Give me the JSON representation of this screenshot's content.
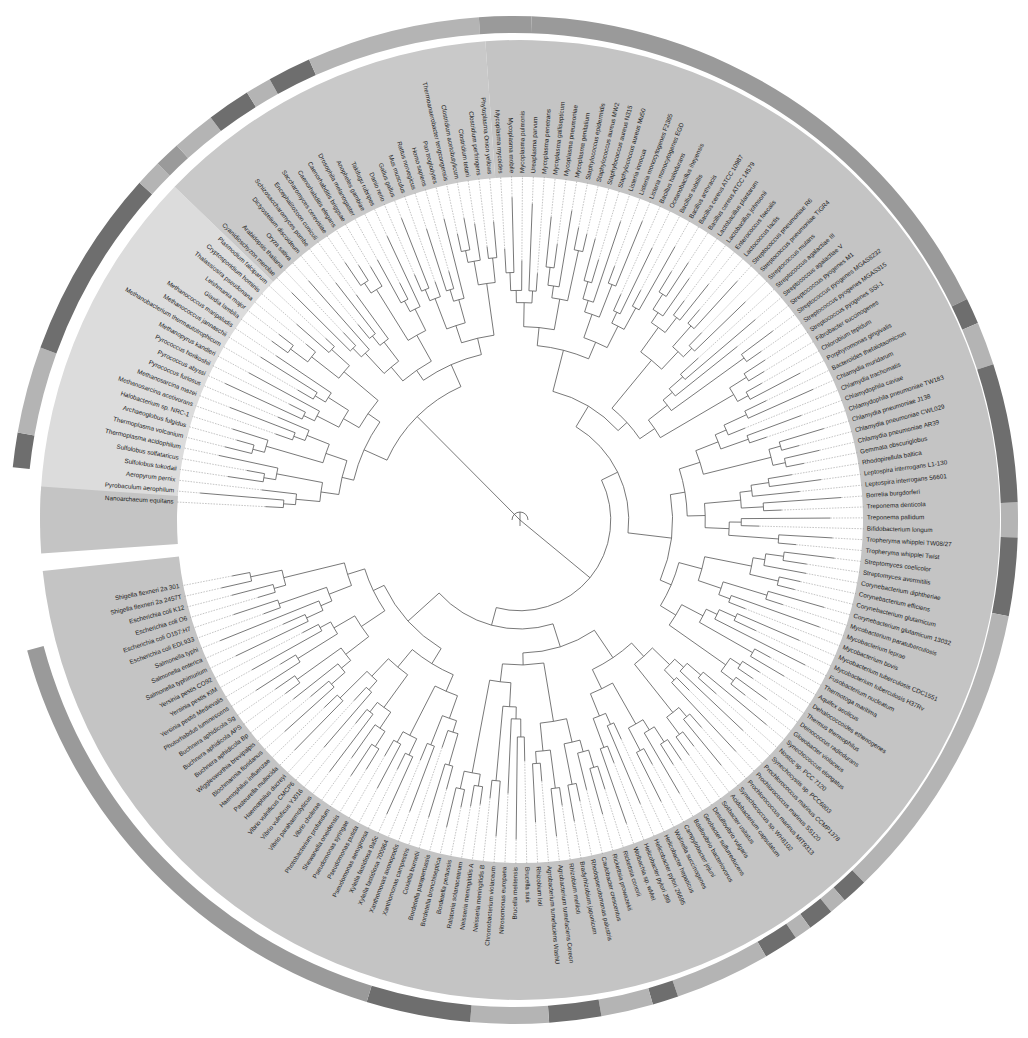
{
  "chart_data": {
    "type": "circular-phylogenetic-tree",
    "title": "",
    "center": [
      520,
      520
    ],
    "layout": {
      "start_angle_deg": 183,
      "end_angle_deg": 529,
      "label_inner_radius": 347,
      "band_inner_radius": 343,
      "band_outer_radius": 480,
      "white_gap_radius": 484,
      "ring_inner_radius": 487,
      "ring_outer_radius": 504,
      "tree_outer_radius": 335
    },
    "colors": {
      "archaea_band": "#dcdcdc",
      "eukaryota_band": "#c9c9c9",
      "bacteria_band": "#c4c4c4",
      "ring_light": "#b4b4b4",
      "ring_mid": "#9a9a9a",
      "ring_dark": "#6e6e6e",
      "branch": "#555555",
      "label": "#222222"
    },
    "clades": [
      {
        "name": "Archaea",
        "from": 0,
        "to": 22,
        "band": "archaea_band"
      },
      {
        "name": "Eukaryota",
        "from": 23,
        "to": 45,
        "band": "eukaryota_band"
      },
      {
        "name": "Bacteria",
        "from": 46,
        "to": 190,
        "band": "bacteria_band"
      }
    ],
    "leaves": [
      "Nanoarchaeum equitans",
      "Pyrobaculum aerophilum",
      "Aeropyrum pernix",
      "Sulfolobus tokodaii",
      "Sulfolobus solfataricus",
      "Thermoplasma acidophilum",
      "Thermoplasma volcanium",
      "Archaeoglobus fulgidus",
      "Halobacterium sp. NRC-1",
      "Methanosarcina acetivorans",
      "Methanosarcina mazei",
      "Pyrococcus furiosus",
      "Pyrococcus abyssi",
      "Pyrococcus horikoshii",
      "Methanopyrus kandleri",
      "Methanobacterium thermautotrophicum",
      "Methanococcus jannaschii",
      "Methanococcus maripaludis",
      "Giardia lamblia",
      "Leishmania major",
      "Thalassiosira pseudonana",
      "Cryptosporidium hominis",
      "Plasmodium falciparum",
      "Cyanidioschyzon merolae",
      "Arabidopsis thaliana",
      "Oryza sativa",
      "Dictyostelium discoideum",
      "Schizosaccharomyces pombe",
      "Encephalitozoon cuniculi",
      "Saccharomyces cerevisiae",
      "Caenorhabditis elegans",
      "Caenorhabditis briggsae",
      "Drosophila melanogaster",
      "Anopheles gambiae",
      "Takifugu rubripes",
      "Danio rerio",
      "Gallus gallus",
      "Mus musculus",
      "Rattus norvegicus",
      "Homo sapiens",
      "Pan troglodytes",
      "Thermoanaerobacter tengcongensis",
      "Clostridium acetobutylicum",
      "Clostridium tetani",
      "Clostridium perfringens",
      "Phytoplasma Onion yellows",
      "Mycoplasma mycoides",
      "Mycoplasma mobile",
      "Mycoplasma pulmonis",
      "Ureaplasma parvum",
      "Mycoplasma penetrans",
      "Mycoplasma gallisepticum",
      "Mycoplasma pneumoniae",
      "Mycoplasma genitalium",
      "Staphylococcus epidermidis",
      "Staphylococcus aureus MW2",
      "Staphylococcus aureus N315",
      "Staphylococcus aureus Mu50",
      "Listeria innocua",
      "Listeria monocytogenes F2365",
      "Listeria monocytogenes EGD",
      "Bacillus halodurans",
      "Oceanobacillus iheyensis",
      "Bacillus subtilis",
      "Bacillus anthracis",
      "Bacillus cereus ATCC 10987",
      "Bacillus cereus ATCC 14579",
      "Lactobacillus plantarum",
      "Lactobacillus johnsonii",
      "Enterococcus faecalis",
      "Lactococcus lactis",
      "Streptococcus pneumoniae R6",
      "Streptococcus pneumoniae TIGR4",
      "Streptococcus mutans",
      "Streptococcus agalactiae III",
      "Streptococcus agalactiae V",
      "Streptococcus pyogenes M1",
      "Streptococcus pyogenes MGAS8232",
      "Streptococcus pyogenes MGAS315",
      "Streptococcus pyogenes SSI-1",
      "Fibrobacter succinogenes",
      "Chlorobium tepidum",
      "Porphyromonas gingivalis",
      "Bacteroides thetaiotaomicron",
      "Chlamydia muridarum",
      "Chlamydia trachomatis",
      "Chlamydophila caviae",
      "Chlamydophila pneumoniae TW183",
      "Chlamydia pneumoniae J138",
      "Chlamydia pneumoniae CWL029",
      "Chlamydia pneumoniae AR39",
      "Gemmata obscuriglobus",
      "Rhodopirellula baltica",
      "Leptospira interrogans L1-130",
      "Leptospira interrogans 56601",
      "Borrelia burgdorferi",
      "Treponema denticola",
      "Treponema pallidum",
      "Bifidobacterium longum",
      "Tropheryma whipplei TW08/27",
      "Tropheryma whipplei Twist",
      "Streptomyces coelicolor",
      "Streptomyces avermitilis",
      "Corynebacterium diphtheriae",
      "Corynebacterium efficiens",
      "Corynebacterium glutamicum",
      "Corynebacterium glutamicum 13032",
      "Mycobacterium paratuberculosis",
      "Mycobacterium leprae",
      "Mycobacterium bovis",
      "Mycobacterium tuberculosis CDC1551",
      "Mycobacterium tuberculosis H37Rv",
      "Fusobacterium nucleatum",
      "Thermotoga maritima",
      "Aquifex aeolicus",
      "Dehalococcoides ethenogenes",
      "Thermus thermophilus",
      "Deinococcus radiodurans",
      "Gloeobacter violaceus",
      "Synechococcus elongatus",
      "Nostoc sp. PCC 7120",
      "Synechocystis sp. PCC6803",
      "Prochlorococcus marinus CCMP1378",
      "Prochlorococcus marinus SS120",
      "Prochlorococcus marinus MIT9313",
      "Synechococcus sp. WH8102",
      "Acidobacterium capsulatum",
      "Solibacter usitatus",
      "Desulfovibrio vulgaris",
      "Geobacter sulfurreducens",
      "Bdellovibrio bacteriovorus",
      "Campylobacter jejuni",
      "Wolinella succinogenes",
      "Helicobacter hepaticus",
      "Helicobacter pylori 26695",
      "Helicobacter pylori J99",
      "Wolbachia sp. wMel",
      "Rickettsia conorii",
      "Rickettsia prowazekii",
      "Caulobacter crescentus",
      "Rhodopseudomonas palustris",
      "Bradyrhizobium japonicum",
      "Rhizobium meliloti",
      "Agrobacterium tumefaciens Cereon",
      "Agrobacterium tumefaciens WashU",
      "Rhizobium loti",
      "Brucella suis",
      "Brucella melitensis",
      "Nitrosomonas europaea",
      "Chromobacterium violaceum",
      "Neisseria meningitidis B",
      "Neisseria meningitidis A",
      "Ralstonia solanacearum",
      "Bordetella pertussis",
      "Bordetella bronchiseptica",
      "Bordetella parapertussis",
      "Coxiella burnetii",
      "Xanthomonas campestris",
      "Xanthomonas axonopodis",
      "Xylella fastidiosa 700964",
      "Xylella fastidiosa 9a5c",
      "Pseudomonas aeruginosa",
      "Pseudomonas putida",
      "Pseudomonas syringae",
      "Shewanella oneidensis",
      "Photobacterium profundum",
      "Vibrio cholerae",
      "Vibrio parahaemolyticus",
      "Vibrio vulnificus YJ016",
      "Vibrio vulnificus CMCP6",
      "Haemophilus ducreyi",
      "Pasteurella multocida",
      "Haemophilus influenzae",
      "Blochmannia floridanus",
      "Wigglesworthia brevipalpis",
      "Buchnera aphidicola Bp",
      "Buchnera aphidicola APS",
      "Buchnera aphidicola Sg",
      "Photorhabdus luminescens",
      "Yersinia pestis Medievalis",
      "Yersinia pestis KIM",
      "Yersinia pestis CO92",
      "Salmonella typhimurium",
      "Salmonella enterica",
      "Salmonella typhi",
      "Escherichia coli EDL933",
      "Escherichia coli O157:H7",
      "Escherichia coli O6",
      "Escherichia coli K12",
      "Shigella flexneri 2a 2457T",
      "Shigella flexneri 2a 301"
    ],
    "outer_ring": [
      {
        "from_deg": 186,
        "to_deg": 190,
        "shade": "ring_dark"
      },
      {
        "from_deg": 190,
        "to_deg": 200,
        "shade": "ring_light"
      },
      {
        "from_deg": 200,
        "to_deg": 222,
        "shade": "ring_dark"
      },
      {
        "from_deg": 222,
        "to_deg": 225,
        "shade": "ring_light"
      },
      {
        "from_deg": 225,
        "to_deg": 228,
        "shade": "ring_mid"
      },
      {
        "from_deg": 228,
        "to_deg": 233,
        "shade": "ring_light"
      },
      {
        "from_deg": 233,
        "to_deg": 238,
        "shade": "ring_dark"
      },
      {
        "from_deg": 238,
        "to_deg": 241,
        "shade": "ring_light"
      },
      {
        "from_deg": 241,
        "to_deg": 246,
        "shade": "ring_dark"
      },
      {
        "from_deg": 246,
        "to_deg": 266,
        "shade": "ring_light"
      },
      {
        "from_deg": 266,
        "to_deg": 272,
        "shade": "ring_mid"
      },
      {
        "from_deg": 272,
        "to_deg": 334,
        "shade": "ring_mid"
      },
      {
        "from_deg": 334,
        "to_deg": 337,
        "shade": "ring_dark"
      },
      {
        "from_deg": 337,
        "to_deg": 342,
        "shade": "ring_light"
      },
      {
        "from_deg": 342,
        "to_deg": 358,
        "shade": "ring_dark"
      },
      {
        "from_deg": 358,
        "to_deg": 362,
        "shade": "ring_light"
      },
      {
        "from_deg": 362,
        "to_deg": 371,
        "shade": "ring_dark"
      },
      {
        "from_deg": 371,
        "to_deg": 406,
        "shade": "ring_light"
      },
      {
        "from_deg": 406,
        "to_deg": 409,
        "shade": "ring_dark"
      },
      {
        "from_deg": 409,
        "to_deg": 411,
        "shade": "ring_light"
      },
      {
        "from_deg": 411,
        "to_deg": 414,
        "shade": "ring_dark"
      },
      {
        "from_deg": 414,
        "to_deg": 416,
        "shade": "ring_light"
      },
      {
        "from_deg": 416,
        "to_deg": 420,
        "shade": "ring_dark"
      },
      {
        "from_deg": 420,
        "to_deg": 431,
        "shade": "ring_light"
      },
      {
        "from_deg": 431,
        "to_deg": 434,
        "shade": "ring_dark"
      },
      {
        "from_deg": 434,
        "to_deg": 440,
        "shade": "ring_light"
      },
      {
        "from_deg": 440,
        "to_deg": 446,
        "shade": "ring_dark"
      },
      {
        "from_deg": 446,
        "to_deg": 455,
        "shade": "ring_light"
      },
      {
        "from_deg": 455,
        "to_deg": 467,
        "shade": "ring_dark"
      },
      {
        "from_deg": 467,
        "to_deg": 525,
        "shade": "ring_mid"
      }
    ]
  }
}
